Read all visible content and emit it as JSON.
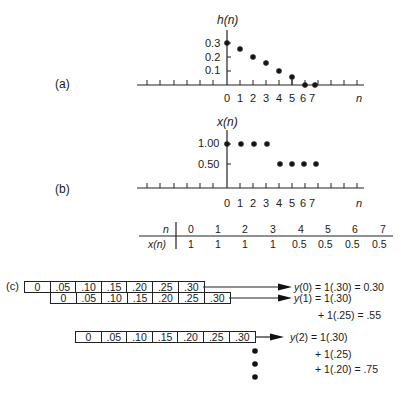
{
  "panels": {
    "a": {
      "label": "(a)",
      "ylabel": "h(n)",
      "xlabel": "n",
      "yticks": [
        "0.3",
        "0.2",
        "0.1"
      ],
      "xticks": [
        "0",
        "1",
        "2",
        "3",
        "4",
        "5",
        "6",
        "7"
      ]
    },
    "b": {
      "label": "(b)",
      "ylabel": "x(n)",
      "xlabel": "n",
      "yticks": [
        "1.00",
        "0.50"
      ],
      "xticks": [
        "0",
        "1",
        "2",
        "3",
        "4",
        "5",
        "6",
        "7"
      ]
    },
    "c": {
      "label": "(c)",
      "rows": [
        {
          "cells": [
            "0",
            ".05",
            ".10",
            ".15",
            ".20",
            ".25",
            ".30"
          ]
        },
        {
          "cells": [
            "0",
            ".05",
            ".10",
            ".15",
            ".20",
            ".25",
            ".30"
          ]
        },
        {
          "cells": [
            "0",
            ".05",
            ".10",
            ".15",
            ".20",
            ".25",
            ".30"
          ]
        }
      ],
      "equations": {
        "y0": "y(0) = 1(.30) = 0.30",
        "y1_l1": "y(1) = 1(.30)",
        "y1_l2": "+ 1(.25) = .55",
        "y2_l1": "y(2) = 1(.30)",
        "y2_l2": "+ 1(.25)",
        "y2_l3": "+ 1(.20) = .75"
      }
    }
  },
  "table": {
    "header_label": "n",
    "row_label": "x(n)",
    "n": [
      "0",
      "1",
      "2",
      "3",
      "4",
      "5",
      "6",
      "7"
    ],
    "x": [
      "1",
      "1",
      "1",
      "1",
      "0.5",
      "0.5",
      "0.5",
      "0.5"
    ]
  },
  "chart_data": [
    {
      "type": "scatter",
      "title": "(a) h(n)",
      "xlabel": "n",
      "ylabel": "h(n)",
      "x": [
        0,
        1,
        2,
        3,
        4,
        5,
        6,
        7
      ],
      "values": [
        0.3,
        0.25,
        0.2,
        0.15,
        0.1,
        0.05,
        0,
        0
      ],
      "yticks": [
        0.1,
        0.2,
        0.3
      ],
      "grid": false
    },
    {
      "type": "scatter",
      "title": "(b) x(n)",
      "xlabel": "n",
      "ylabel": "x(n)",
      "x": [
        0,
        1,
        2,
        3,
        4,
        5,
        6,
        7
      ],
      "values": [
        1,
        1,
        1,
        1,
        0.5,
        0.5,
        0.5,
        0.5
      ],
      "yticks": [
        0.5,
        1.0
      ],
      "grid": false
    }
  ]
}
